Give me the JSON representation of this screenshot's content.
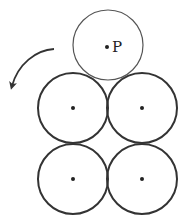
{
  "diagram": {
    "moving_coin": {
      "label": "P",
      "cx": 108,
      "cy": 45,
      "r": 35,
      "stroke": "#555555",
      "stroke_width": 1.2
    },
    "fixed_coins": [
      {
        "cx": 73,
        "cy": 108,
        "r": 35
      },
      {
        "cx": 142,
        "cy": 108,
        "r": 35
      },
      {
        "cx": 73,
        "cy": 179,
        "r": 35
      },
      {
        "cx": 142,
        "cy": 179,
        "r": 35
      }
    ],
    "fixed_stroke": "#333333",
    "fixed_stroke_width": 2,
    "arrow": {
      "direction": "counterclockwise",
      "color": "#333333"
    }
  }
}
